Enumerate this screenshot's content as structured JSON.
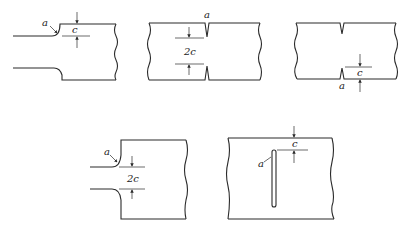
{
  "figure": {
    "panels": [
      {
        "id": "shoulder-single",
        "radius_label": "a",
        "dim_label": "c"
      },
      {
        "id": "double-edge-notch",
        "radius_label": "a",
        "dim_label": "2c"
      },
      {
        "id": "single-edge-notch",
        "radius_label": "a",
        "dim_label": "c"
      },
      {
        "id": "double-shoulder",
        "radius_label": "a",
        "dim_label": "2c"
      },
      {
        "id": "internal-slot",
        "radius_label": "a",
        "dim_label": "c"
      }
    ]
  }
}
